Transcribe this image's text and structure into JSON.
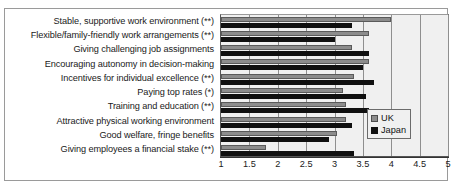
{
  "chart_data": {
    "type": "bar",
    "orientation": "horizontal",
    "title": "",
    "xlabel": "",
    "ylabel": "",
    "xlim": [
      1,
      5
    ],
    "grid": true,
    "legend_position": "right-lower",
    "tick_labels": [
      "1",
      "1.5",
      "2",
      "2.5",
      "3",
      "3.5",
      "4",
      "4.5",
      "5"
    ],
    "tick_values": [
      1,
      1.5,
      2,
      2.5,
      3,
      3.5,
      4,
      4.5,
      5
    ],
    "categories": [
      "Stable, supportive work environment (**)",
      "Flexible/family-friendly work arrangements  (**)",
      "Giving challenging job assignments",
      "Encouraging autonomy in decision-making",
      "Incentives for individual excellence (**)",
      "Paying top rates (*)",
      "Training and education (**)",
      "Attractive physical working environment",
      "Good welfare, fringe benefits",
      "Giving employees a financial stake (**)"
    ],
    "series": [
      {
        "name": "UK",
        "color": "#8c8c8c",
        "values": [
          4.0,
          3.6,
          3.3,
          3.6,
          3.35,
          3.15,
          3.2,
          3.2,
          3.05,
          1.8
        ]
      },
      {
        "name": "Japan",
        "color": "#101010",
        "values": [
          3.3,
          3.0,
          3.6,
          3.5,
          3.7,
          3.55,
          3.6,
          3.3,
          2.9,
          3.35
        ]
      }
    ]
  },
  "legend": {
    "entries": [
      {
        "label": "UK",
        "swatch": "uk"
      },
      {
        "label": "Japan",
        "swatch": "jp"
      }
    ]
  }
}
